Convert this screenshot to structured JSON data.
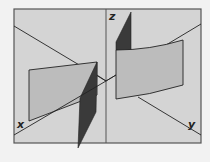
{
  "diagram": {
    "colors": {
      "background": "#f2f2f2",
      "panel_fill": "#d4d4d4",
      "frame": "#555555",
      "light_surface": "#bcbcbc",
      "dark_plane": "#3a3a3a",
      "axis_line": "#222222"
    },
    "axes": {
      "x_label": "x",
      "y_label": "y",
      "z_label": "z"
    },
    "panels": [
      {
        "id": "left",
        "content": "flat light quadrilateral with dark triangular plane passing through it, x-axis line"
      },
      {
        "id": "right",
        "content": "curved light surface with dark triangle above, z and y axes"
      }
    ]
  }
}
